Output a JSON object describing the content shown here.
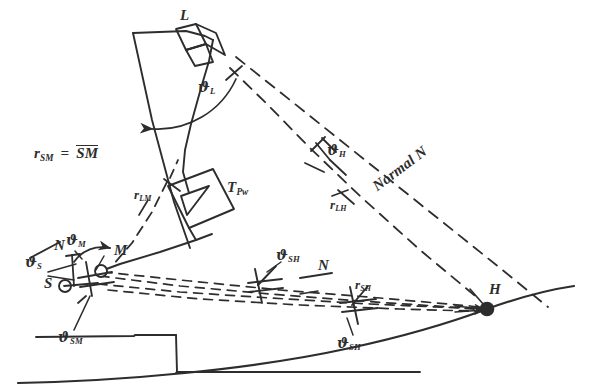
{
  "figure": {
    "kind": "hand-drawn geometric survey / radar sighting diagram",
    "background_color": "#ffffff",
    "ink_color": "#2d2d2d"
  },
  "points": {
    "L": "L",
    "M": "M",
    "S": "S",
    "H": "H"
  },
  "angles": {
    "theta_L": {
      "symbol": "ϑ",
      "sub": "L"
    },
    "theta_H": {
      "symbol": "ϑ",
      "sub": "H"
    },
    "theta_M": {
      "symbol": "ϑ",
      "sub": "M"
    },
    "theta_S": {
      "symbol": "ϑ",
      "sub": "S"
    },
    "theta_SM": {
      "symbol": "ϑ",
      "sub": "SM"
    },
    "theta_SH_upper": {
      "symbol": "ϑ",
      "sub": "SH"
    },
    "theta_SH_lower": {
      "symbol": "ϑ",
      "sub": "SH"
    }
  },
  "ranges": {
    "r_LM": {
      "symbol": "r",
      "sub": "LM"
    },
    "r_LH": {
      "symbol": "r",
      "sub": "LH"
    },
    "r_SH": {
      "symbol": "r",
      "sub": "SH"
    },
    "r_SM": {
      "symbol": "r",
      "sub": "SM"
    }
  },
  "normals": {
    "normal_left": "N",
    "normal_middle": "N",
    "normal_long": "Normal N"
  },
  "equation": {
    "lhs_symbol": "r",
    "lhs_sub": "SM",
    "eq": "=",
    "rhs_overline": "SM"
  },
  "device": {
    "label_symbol": "T",
    "label_sub": "Pw",
    "shape": "tilted-square-with-triangle"
  }
}
